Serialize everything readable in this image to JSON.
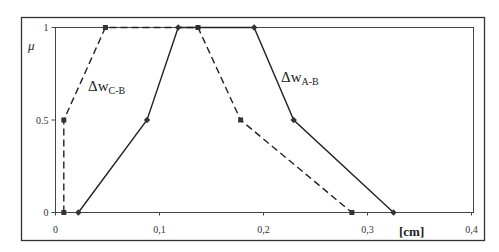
{
  "chart_data": {
    "type": "line",
    "title": "",
    "xlabel": "[cm]",
    "ylabel": "μ",
    "xlim": [
      0,
      0.4
    ],
    "ylim": [
      0,
      1
    ],
    "x_ticks": [
      "0",
      "0,1",
      "0,2",
      "0,3",
      "0,4"
    ],
    "y_ticks": [
      "0",
      "0.5",
      "1"
    ],
    "grid": false,
    "legend": "inline labels",
    "series": [
      {
        "name": "ΔwC-B",
        "label_main": "Δw",
        "label_sub": "C-B",
        "style": "dashed",
        "marker": "square",
        "x": [
          0.008,
          0.008,
          0.048,
          0.137,
          0.178,
          0.285
        ],
        "y": [
          0,
          0.5,
          1,
          1,
          0.5,
          0
        ]
      },
      {
        "name": "ΔwA-B",
        "label_main": "Δw",
        "label_sub": "A-B",
        "style": "solid",
        "marker": "diamond",
        "x": [
          0.022,
          0.088,
          0.118,
          0.191,
          0.229,
          0.325
        ],
        "y": [
          0,
          0.5,
          1,
          1,
          0.5,
          0
        ]
      }
    ]
  }
}
